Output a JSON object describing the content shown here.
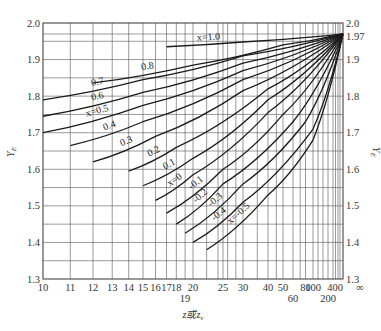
{
  "chart_data": {
    "type": "line",
    "title": "",
    "xlabel": "z或zv",
    "ylabel": "YE",
    "ylabel_right": "YE",
    "x_scale": "reciprocal (linear in 1/z)",
    "xlim": [
      10,
      "∞"
    ],
    "ylim": [
      1.3,
      2.0
    ],
    "grid": true,
    "legend": "inline curve labels",
    "x_ticks": [
      "10",
      "11",
      "12",
      "13",
      "14",
      "15",
      "16",
      "17",
      "18",
      "19",
      "20",
      "25",
      "30",
      "40",
      "50",
      "60",
      "80",
      "100",
      "200",
      "400",
      "∞"
    ],
    "y_ticks_left": [
      "1.3",
      "1.4",
      "1.5",
      "1.6",
      "1.7",
      "1.8",
      "1.9",
      "2.0"
    ],
    "y_ticks_right": [
      "1.3",
      "1.4",
      "1.5",
      "1.6",
      "1.7",
      "1.8",
      "1.9",
      "1.97",
      "2.0"
    ],
    "convergence_point": {
      "z": "∞",
      "y": 1.97
    },
    "series": [
      {
        "name": "x=1.0",
        "label": "x=1.0",
        "points": [
          [
            17,
            1.935
          ],
          [
            30,
            1.948
          ],
          [
            100,
            1.962
          ],
          [
            "∞",
            1.97
          ]
        ]
      },
      {
        "name": "x=0.8",
        "label": "0.8",
        "points": [
          [
            12,
            1.836
          ],
          [
            20,
            1.885
          ],
          [
            50,
            1.94
          ],
          [
            "∞",
            1.97
          ]
        ]
      },
      {
        "name": "x=0.7",
        "label": "0.7",
        "points": [
          [
            10,
            1.79
          ],
          [
            15,
            1.845
          ],
          [
            30,
            1.91
          ],
          [
            "∞",
            1.97
          ]
        ]
      },
      {
        "name": "x=0.6",
        "label": "0.6",
        "points": [
          [
            10,
            1.745
          ],
          [
            15,
            1.81
          ],
          [
            30,
            1.89
          ],
          [
            "∞",
            1.97
          ]
        ]
      },
      {
        "name": "x=0.5",
        "label": "x=0.5",
        "points": [
          [
            10,
            1.7
          ],
          [
            15,
            1.775
          ],
          [
            30,
            1.87
          ],
          [
            "∞",
            1.97
          ]
        ]
      },
      {
        "name": "x=0.4",
        "label": "0.4",
        "points": [
          [
            11,
            1.665
          ],
          [
            15,
            1.73
          ],
          [
            30,
            1.845
          ],
          [
            "∞",
            1.97
          ]
        ]
      },
      {
        "name": "x=0.3",
        "label": "0.3",
        "points": [
          [
            12,
            1.62
          ],
          [
            16,
            1.69
          ],
          [
            30,
            1.815
          ],
          [
            "∞",
            1.97
          ]
        ]
      },
      {
        "name": "x=0.2",
        "label": "0.2",
        "points": [
          [
            14,
            1.595
          ],
          [
            18,
            1.66
          ],
          [
            40,
            1.82
          ],
          [
            "∞",
            1.97
          ]
        ]
      },
      {
        "name": "x=0.1",
        "label": "0.1",
        "points": [
          [
            15,
            1.555
          ],
          [
            20,
            1.63
          ],
          [
            40,
            1.79
          ],
          [
            "∞",
            1.97
          ]
        ]
      },
      {
        "name": "x=0",
        "label": "x=0",
        "points": [
          [
            16,
            1.515
          ],
          [
            20,
            1.585
          ],
          [
            40,
            1.755
          ],
          [
            "∞",
            1.97
          ]
        ]
      },
      {
        "name": "x=-0.1",
        "label": "-0.1",
        "points": [
          [
            17,
            1.48
          ],
          [
            25,
            1.6
          ],
          [
            50,
            1.75
          ],
          [
            "∞",
            1.97
          ]
        ]
      },
      {
        "name": "x=-0.2",
        "label": "-0.2",
        "points": [
          [
            18,
            1.45
          ],
          [
            25,
            1.56
          ],
          [
            60,
            1.73
          ],
          [
            "∞",
            1.97
          ]
        ]
      },
      {
        "name": "x=-0.3",
        "label": "-0.3",
        "points": [
          [
            19,
            1.425
          ],
          [
            30,
            1.56
          ],
          [
            80,
            1.73
          ],
          [
            "∞",
            1.97
          ]
        ]
      },
      {
        "name": "x=-0.4",
        "label": "-0.4",
        "points": [
          [
            20,
            1.4
          ],
          [
            30,
            1.51
          ],
          [
            100,
            1.71
          ],
          [
            "∞",
            1.97
          ]
        ]
      },
      {
        "name": "x=-0.5",
        "label": "x=-0.5",
        "points": [
          [
            22,
            1.38
          ],
          [
            40,
            1.53
          ],
          [
            100,
            1.68
          ],
          [
            "∞",
            1.97
          ]
        ]
      }
    ]
  },
  "labels": {
    "xlabel": "z或z",
    "xlabel_sub": "v",
    "ylabel": "Y",
    "ylabel_sub": "E"
  }
}
